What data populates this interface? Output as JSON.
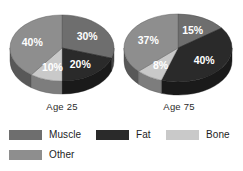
{
  "chart_data": [
    {
      "type": "pie",
      "title": "Age 25",
      "categories": [
        "Muscle",
        "Fat",
        "Bone",
        "Other"
      ],
      "values": [
        30,
        20,
        10,
        40
      ],
      "labels": [
        "30%",
        "20%",
        "10%",
        "40%"
      ],
      "colors": [
        "#6e6e6e",
        "#2a2a2a",
        "#c9c9c9",
        "#8e8e8e"
      ],
      "legend_position": "bottom",
      "grid": false
    },
    {
      "type": "pie",
      "title": "Age 75",
      "categories": [
        "Muscle",
        "Fat",
        "Bone",
        "Other"
      ],
      "values": [
        15,
        40,
        8,
        37
      ],
      "labels": [
        "15%",
        "40%",
        "8%",
        "37%"
      ],
      "colors": [
        "#6e6e6e",
        "#2a2a2a",
        "#c9c9c9",
        "#8e8e8e"
      ],
      "legend_position": "bottom",
      "grid": false
    }
  ],
  "charts": {
    "left": {
      "axis_label": "Age 25",
      "slices": [
        {
          "name": "Muscle",
          "label": "30%"
        },
        {
          "name": "Fat",
          "label": "20%"
        },
        {
          "name": "Bone",
          "label": "10%"
        },
        {
          "name": "Other",
          "label": "40%"
        }
      ]
    },
    "right": {
      "axis_label": "Age 75",
      "slices": [
        {
          "name": "Muscle",
          "label": "15%"
        },
        {
          "name": "Fat",
          "label": "40%"
        },
        {
          "name": "Bone",
          "label": "8%"
        },
        {
          "name": "Other",
          "label": "37%"
        }
      ]
    }
  },
  "legend": {
    "items": [
      {
        "label": "Muscle",
        "color": "#6e6e6e"
      },
      {
        "label": "Fat",
        "color": "#2a2a2a"
      },
      {
        "label": "Bone",
        "color": "#c9c9c9"
      },
      {
        "label": "Other",
        "color": "#8e8e8e"
      }
    ]
  },
  "colors": {
    "muscle": "#6e6e6e",
    "fat": "#2a2a2a",
    "bone": "#c9c9c9",
    "other": "#8e8e8e",
    "background": "#ffffff",
    "text": "#1d1d1d"
  }
}
